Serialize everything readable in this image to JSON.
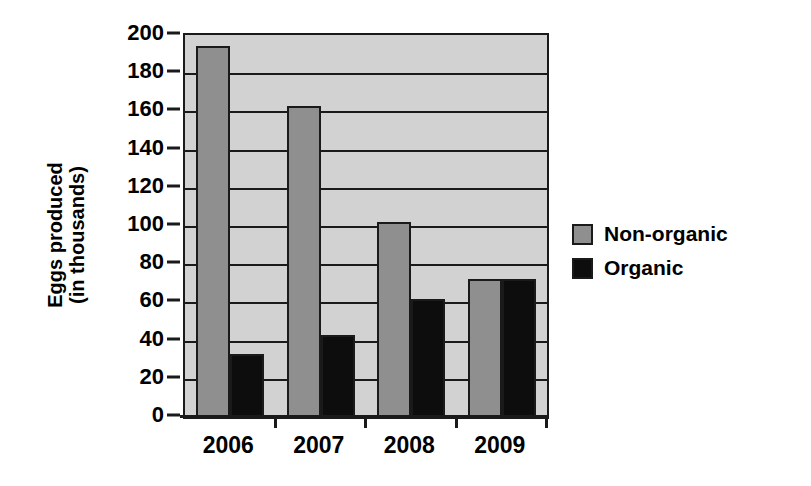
{
  "chart_data": {
    "type": "bar",
    "title": "",
    "xlabel": "",
    "ylabel": "Eggs produced\n(in thousands)",
    "ylabel_line1": "Eggs produced",
    "ylabel_line2": "(in thousands)",
    "categories": [
      "2006",
      "2007",
      "2008",
      "2009"
    ],
    "series": [
      {
        "name": "Non-organic",
        "color": "#8f8f8f",
        "values": [
          194,
          163,
          102,
          72
        ]
      },
      {
        "name": "Organic",
        "color": "#0d0d0d",
        "values": [
          33,
          43,
          62,
          72
        ]
      }
    ],
    "ylim": [
      0,
      200
    ],
    "ytick_step": 20,
    "ytick_labels": [
      "200",
      "180",
      "160",
      "140",
      "120",
      "100",
      "80",
      "60",
      "40",
      "20",
      "0"
    ],
    "grid": true,
    "grid_orientation": "horizontal",
    "legend_position": "right",
    "plot_background": "#d2d2d2",
    "axis_color": "#1a1a1a"
  },
  "legend": {
    "items": [
      {
        "label": "Non-organic",
        "swatch": "nonorganic"
      },
      {
        "label": "Organic",
        "swatch": "organic"
      }
    ]
  }
}
